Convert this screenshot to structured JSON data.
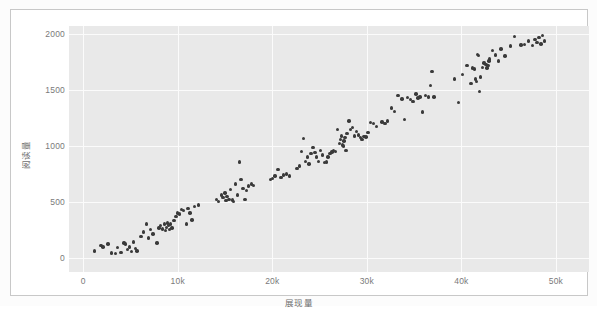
{
  "chart_data": {
    "type": "scatter",
    "title": "",
    "xlabel": "展现量",
    "ylabel": "阅读量",
    "xlim": [
      -1500,
      53500
    ],
    "ylim": [
      -130,
      2075
    ],
    "xticks": [
      0,
      10000,
      20000,
      30000,
      40000,
      50000
    ],
    "xticklabels": [
      "0",
      "10k",
      "20k",
      "30k",
      "40k",
      "50k"
    ],
    "yticks": [
      0,
      500,
      1000,
      1500,
      2000
    ],
    "yticklabels": [
      "0",
      "500",
      "1000",
      "1500",
      "2000"
    ],
    "grid": true,
    "grid_color": "#fbfbfb",
    "panel_background": "#e9e9e9",
    "marker_color": "#3a3a3a",
    "marker_size": 3.4,
    "legend": null,
    "n_points": 178,
    "points": [
      [
        1200,
        60
      ],
      [
        1900,
        110
      ],
      [
        2100,
        95
      ],
      [
        2600,
        120
      ],
      [
        3000,
        40
      ],
      [
        3400,
        35
      ],
      [
        3600,
        90
      ],
      [
        4000,
        45
      ],
      [
        4300,
        130
      ],
      [
        4500,
        120
      ],
      [
        4700,
        70
      ],
      [
        4900,
        95
      ],
      [
        5100,
        55
      ],
      [
        5300,
        140
      ],
      [
        5500,
        80
      ],
      [
        5700,
        60
      ],
      [
        6100,
        190
      ],
      [
        6400,
        230
      ],
      [
        6700,
        300
      ],
      [
        6900,
        175
      ],
      [
        7100,
        250
      ],
      [
        7400,
        210
      ],
      [
        7800,
        130
      ],
      [
        8000,
        265
      ],
      [
        8200,
        285
      ],
      [
        8400,
        255
      ],
      [
        8600,
        300
      ],
      [
        8700,
        240
      ],
      [
        8800,
        270
      ],
      [
        8900,
        310
      ],
      [
        9000,
        285
      ],
      [
        9100,
        250
      ],
      [
        9200,
        300
      ],
      [
        9400,
        265
      ],
      [
        9600,
        330
      ],
      [
        9800,
        370
      ],
      [
        10000,
        400
      ],
      [
        10200,
        390
      ],
      [
        10400,
        430
      ],
      [
        10600,
        420
      ],
      [
        10900,
        300
      ],
      [
        11100,
        440
      ],
      [
        11300,
        400
      ],
      [
        11500,
        335
      ],
      [
        11800,
        455
      ],
      [
        12200,
        470
      ],
      [
        14100,
        520
      ],
      [
        14300,
        500
      ],
      [
        14600,
        560
      ],
      [
        14800,
        540
      ],
      [
        15000,
        580
      ],
      [
        15100,
        510
      ],
      [
        15200,
        545
      ],
      [
        15400,
        520
      ],
      [
        15600,
        610
      ],
      [
        15800,
        515
      ],
      [
        15900,
        505
      ],
      [
        16100,
        660
      ],
      [
        16300,
        560
      ],
      [
        16500,
        855
      ],
      [
        16700,
        700
      ],
      [
        16900,
        620
      ],
      [
        17100,
        520
      ],
      [
        17300,
        600
      ],
      [
        17500,
        640
      ],
      [
        17800,
        660
      ],
      [
        18000,
        645
      ],
      [
        19800,
        700
      ],
      [
        20000,
        710
      ],
      [
        20300,
        730
      ],
      [
        20600,
        790
      ],
      [
        20900,
        720
      ],
      [
        21200,
        740
      ],
      [
        21500,
        750
      ],
      [
        21800,
        730
      ],
      [
        22600,
        800
      ],
      [
        22900,
        820
      ],
      [
        23100,
        950
      ],
      [
        23300,
        1065
      ],
      [
        23500,
        860
      ],
      [
        23700,
        900
      ],
      [
        23900,
        840
      ],
      [
        24100,
        930
      ],
      [
        24300,
        985
      ],
      [
        24500,
        940
      ],
      [
        24700,
        900
      ],
      [
        24900,
        860
      ],
      [
        25100,
        960
      ],
      [
        25300,
        920
      ],
      [
        25500,
        850
      ],
      [
        25700,
        855
      ],
      [
        25900,
        900
      ],
      [
        26100,
        930
      ],
      [
        26300,
        945
      ],
      [
        26500,
        960
      ],
      [
        26700,
        950
      ],
      [
        26900,
        1150
      ],
      [
        27100,
        1020
      ],
      [
        27200,
        1060
      ],
      [
        27300,
        1090
      ],
      [
        27400,
        1010
      ],
      [
        27500,
        1000
      ],
      [
        27600,
        1045
      ],
      [
        27700,
        1075
      ],
      [
        27800,
        960
      ],
      [
        27900,
        1110
      ],
      [
        28100,
        1225
      ],
      [
        28300,
        1150
      ],
      [
        28500,
        1165
      ],
      [
        28700,
        1090
      ],
      [
        28900,
        1130
      ],
      [
        29100,
        1100
      ],
      [
        29300,
        1075
      ],
      [
        29500,
        1060
      ],
      [
        29700,
        1085
      ],
      [
        29900,
        1080
      ],
      [
        30100,
        1120
      ],
      [
        30400,
        1210
      ],
      [
        30700,
        1200
      ],
      [
        31000,
        1175
      ],
      [
        31600,
        1215
      ],
      [
        31900,
        1200
      ],
      [
        32200,
        1225
      ],
      [
        32600,
        1340
      ],
      [
        32900,
        1310
      ],
      [
        33300,
        1450
      ],
      [
        33700,
        1420
      ],
      [
        34000,
        1240
      ],
      [
        34300,
        1435
      ],
      [
        34600,
        1415
      ],
      [
        34900,
        1400
      ],
      [
        35200,
        1465
      ],
      [
        35400,
        1430
      ],
      [
        35600,
        1440
      ],
      [
        35900,
        1305
      ],
      [
        36200,
        1450
      ],
      [
        36500,
        1440
      ],
      [
        36700,
        1540
      ],
      [
        36900,
        1665
      ],
      [
        37100,
        1440
      ],
      [
        39300,
        1600
      ],
      [
        39700,
        1390
      ],
      [
        40100,
        1640
      ],
      [
        40600,
        1720
      ],
      [
        41000,
        1560
      ],
      [
        41200,
        1700
      ],
      [
        41400,
        1690
      ],
      [
        41500,
        1600
      ],
      [
        41600,
        1580
      ],
      [
        41700,
        1820
      ],
      [
        41800,
        1810
      ],
      [
        41900,
        1490
      ],
      [
        42000,
        1620
      ],
      [
        42200,
        1705
      ],
      [
        42400,
        1745
      ],
      [
        42600,
        1730
      ],
      [
        42700,
        1700
      ],
      [
        42800,
        1720
      ],
      [
        42900,
        1760
      ],
      [
        43000,
        1780
      ],
      [
        43300,
        1855
      ],
      [
        43600,
        1815
      ],
      [
        43900,
        1760
      ],
      [
        44200,
        1870
      ],
      [
        44600,
        1805
      ],
      [
        45200,
        1895
      ],
      [
        45600,
        1980
      ],
      [
        46300,
        1905
      ],
      [
        46700,
        1910
      ],
      [
        47100,
        1940
      ],
      [
        47500,
        1900
      ],
      [
        47800,
        1955
      ],
      [
        48000,
        1930
      ],
      [
        48200,
        1970
      ],
      [
        48400,
        1915
      ],
      [
        48600,
        1990
      ],
      [
        48800,
        1940
      ]
    ]
  }
}
